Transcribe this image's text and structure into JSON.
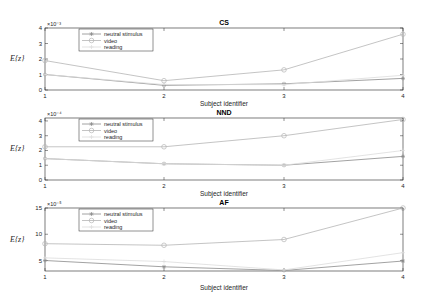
{
  "chart_data": [
    {
      "type": "line",
      "title": "CS",
      "xlabel": "Subject identifier",
      "ylabel": "E{z}",
      "y_exponent": "×10⁻³",
      "x": [
        1,
        2,
        3,
        4
      ],
      "ylim": [
        0,
        4
      ],
      "yticks": [
        0,
        1,
        2,
        3,
        4
      ],
      "series": [
        {
          "name": "neutral stimulus",
          "marker": "*",
          "values": [
            1.0,
            0.3,
            0.4,
            0.75
          ]
        },
        {
          "name": "video",
          "marker": "o",
          "values": [
            1.9,
            0.6,
            1.3,
            3.6
          ]
        },
        {
          "name": "reading",
          "marker": "+",
          "values": [
            1.0,
            0.35,
            0.35,
            0.95
          ]
        }
      ],
      "legend_position": "upper-left",
      "grid": false
    },
    {
      "type": "line",
      "title": "NND",
      "xlabel": "Subject identifier",
      "ylabel": "E{z}",
      "y_exponent": "×10⁻⁴",
      "x": [
        1,
        2,
        3,
        4
      ],
      "ylim": [
        0,
        4.2
      ],
      "yticks": [
        0,
        1,
        2,
        3,
        4
      ],
      "series": [
        {
          "name": "neutral stimulus",
          "marker": "*",
          "values": [
            1.45,
            1.1,
            1.0,
            1.6
          ]
        },
        {
          "name": "video",
          "marker": "o",
          "values": [
            2.25,
            2.25,
            3.0,
            4.1
          ]
        },
        {
          "name": "reading",
          "marker": "+",
          "values": [
            1.45,
            1.1,
            1.0,
            2.0
          ]
        }
      ],
      "legend_position": "upper-left",
      "grid": false
    },
    {
      "type": "line",
      "title": "AF",
      "xlabel": "Subject identifier",
      "ylabel": "E{z}",
      "y_exponent": "×10⁻⁵",
      "x": [
        1,
        2,
        3,
        4
      ],
      "ylim": [
        3,
        15
      ],
      "yticks": [
        5,
        10,
        15
      ],
      "series": [
        {
          "name": "neutral stimulus",
          "marker": "*",
          "values": [
            5.0,
            3.8,
            3.1,
            4.9
          ]
        },
        {
          "name": "video",
          "marker": "o",
          "values": [
            8.2,
            7.9,
            9.0,
            15.0
          ]
        },
        {
          "name": "reading",
          "marker": "+",
          "values": [
            5.5,
            4.8,
            3.2,
            6.5
          ]
        }
      ],
      "legend_position": "upper-left",
      "grid": false
    }
  ],
  "colors": {
    "neutral stimulus": "#8a8a8a",
    "video": "#b5b5b5",
    "reading": "#dcdcdc",
    "axes": "#262626"
  }
}
